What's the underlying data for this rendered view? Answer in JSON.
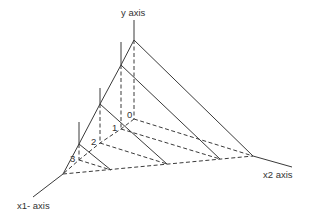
{
  "diagram": {
    "type": "3d-axis-line-diagram",
    "labels": {
      "y_axis": "y axis",
      "x1_axis": "x1- axis",
      "x2_axis": "x2 axis"
    },
    "point_labels": [
      "0",
      "1",
      "2",
      "3"
    ],
    "colors": {
      "line": "#3a3a3a",
      "text": "#333333",
      "background": "#ffffff"
    },
    "vertices": {
      "apex": [
        134,
        40
      ],
      "x1_end": [
        63,
        174
      ],
      "x2_end": [
        253,
        156
      ]
    },
    "levels": [
      {
        "label": "0",
        "top": [
          134,
          40
        ],
        "tick_top": [
          134,
          20
        ],
        "base": [
          134,
          119
        ],
        "far": [
          253,
          156
        ]
      },
      {
        "label": "1",
        "top": [
          121,
          65
        ],
        "tick_top": [
          121,
          42
        ],
        "base": [
          121,
          129
        ],
        "far": [
          220,
          159
        ]
      },
      {
        "label": "2",
        "top": [
          100,
          104
        ],
        "tick_top": [
          100,
          88
        ],
        "base": [
          100,
          143
        ],
        "far": [
          167,
          164
        ]
      },
      {
        "label": "3",
        "top": [
          79,
          144
        ],
        "tick_top": [
          79,
          122
        ],
        "base": [
          79,
          160
        ],
        "far": [
          111,
          170
        ]
      }
    ]
  }
}
